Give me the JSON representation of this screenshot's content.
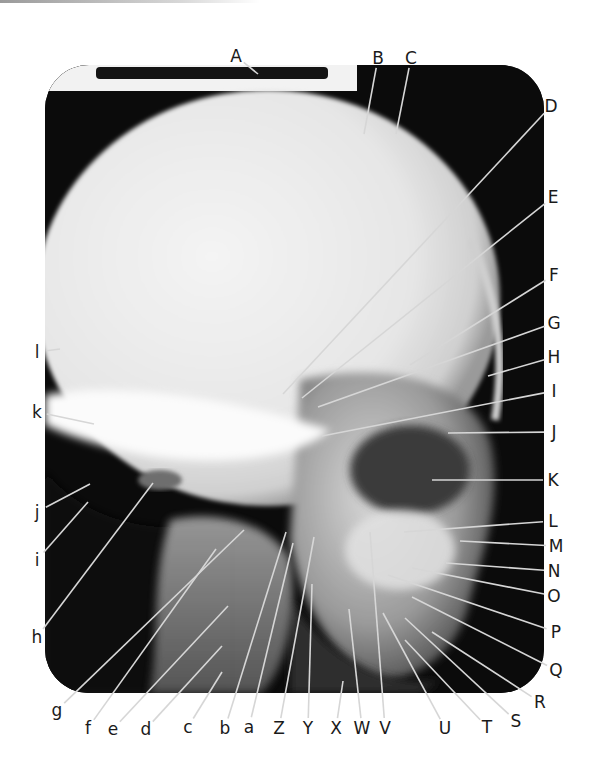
{
  "figure": {
    "labels_top": [
      "A",
      "B",
      "C"
    ],
    "labels_right": [
      "D",
      "E",
      "F",
      "G",
      "H",
      "I",
      "J",
      "K",
      "L",
      "M",
      "N",
      "O",
      "P",
      "Q",
      "R",
      "S"
    ],
    "labels_bottom": [
      "T",
      "U",
      "V",
      "W",
      "X",
      "Y",
      "Z",
      "a",
      "b",
      "c",
      "d",
      "e",
      "f",
      "g"
    ],
    "labels_left": [
      "h",
      "i",
      "j",
      "k",
      "l"
    ]
  },
  "labels": [
    {
      "id": "A",
      "x": 236,
      "y": 56,
      "tx": 258,
      "ty": 74
    },
    {
      "id": "B",
      "x": 378,
      "y": 58,
      "tx": 364,
      "ty": 134
    },
    {
      "id": "C",
      "x": 411,
      "y": 58,
      "tx": 396,
      "ty": 134
    },
    {
      "id": "D",
      "x": 551,
      "y": 106,
      "tx": 283,
      "ty": 394
    },
    {
      "id": "E",
      "x": 553,
      "y": 197,
      "tx": 302,
      "ty": 398
    },
    {
      "id": "F",
      "x": 554,
      "y": 275,
      "tx": 410,
      "ty": 365
    },
    {
      "id": "G",
      "x": 554,
      "y": 323,
      "tx": 318,
      "ty": 407
    },
    {
      "id": "H",
      "x": 554,
      "y": 357,
      "tx": 488,
      "ty": 376
    },
    {
      "id": "I",
      "x": 554,
      "y": 391,
      "tx": 322,
      "ty": 436
    },
    {
      "id": "J",
      "x": 554,
      "y": 432,
      "tx": 448,
      "ty": 433
    },
    {
      "id": "K",
      "x": 553,
      "y": 480,
      "tx": 432,
      "ty": 480
    },
    {
      "id": "L",
      "x": 553,
      "y": 521,
      "tx": 404,
      "ty": 532
    },
    {
      "id": "M",
      "x": 556,
      "y": 546,
      "tx": 460,
      "ty": 541
    },
    {
      "id": "N",
      "x": 554,
      "y": 571,
      "tx": 446,
      "ty": 563
    },
    {
      "id": "O",
      "x": 554,
      "y": 596,
      "tx": 412,
      "ty": 568
    },
    {
      "id": "P",
      "x": 556,
      "y": 632,
      "tx": 388,
      "ty": 575
    },
    {
      "id": "Q",
      "x": 556,
      "y": 670,
      "tx": 412,
      "ty": 597
    },
    {
      "id": "R",
      "x": 540,
      "y": 702,
      "tx": 432,
      "ty": 632
    },
    {
      "id": "S",
      "x": 516,
      "y": 721,
      "tx": 405,
      "ty": 618
    },
    {
      "id": "T",
      "x": 487,
      "y": 727,
      "tx": 405,
      "ty": 640
    },
    {
      "id": "U",
      "x": 445,
      "y": 728,
      "tx": 383,
      "ty": 613
    },
    {
      "id": "V",
      "x": 385,
      "y": 728,
      "tx": 370,
      "ty": 532
    },
    {
      "id": "W",
      "x": 362,
      "y": 728,
      "tx": 349,
      "ty": 609
    },
    {
      "id": "X",
      "x": 336,
      "y": 728,
      "tx": 343,
      "ty": 681
    },
    {
      "id": "Y",
      "x": 308,
      "y": 728,
      "tx": 312,
      "ty": 584
    },
    {
      "id": "Z",
      "x": 279,
      "y": 728,
      "tx": 314,
      "ty": 537
    },
    {
      "id": "a",
      "x": 249,
      "y": 727,
      "tx": 293,
      "ty": 543
    },
    {
      "id": "b",
      "x": 225,
      "y": 728,
      "tx": 286,
      "ty": 532
    },
    {
      "id": "c",
      "x": 188,
      "y": 727,
      "tx": 222,
      "ty": 672
    },
    {
      "id": "d",
      "x": 146,
      "y": 729,
      "tx": 222,
      "ty": 646
    },
    {
      "id": "e",
      "x": 113,
      "y": 729,
      "tx": 228,
      "ty": 606
    },
    {
      "id": "f",
      "x": 88,
      "y": 728,
      "tx": 216,
      "ty": 549
    },
    {
      "id": "g",
      "x": 57,
      "y": 710,
      "tx": 244,
      "ty": 530
    },
    {
      "id": "h",
      "x": 37,
      "y": 637,
      "tx": 153,
      "ty": 483
    },
    {
      "id": "i",
      "x": 37,
      "y": 560,
      "tx": 88,
      "ty": 502
    },
    {
      "id": "j",
      "x": 37,
      "y": 512,
      "tx": 90,
      "ty": 484
    },
    {
      "id": "k",
      "x": 37,
      "y": 412,
      "tx": 94,
      "ty": 424
    },
    {
      "id": "l",
      "x": 37,
      "y": 352,
      "tx": 60,
      "ty": 349
    }
  ],
  "colors": {
    "background": "#ffffff",
    "film": "#0b0b0b",
    "bone": "#e9e9e9",
    "leader_line": "#d6d6d6",
    "label_text": "#1a1a1a"
  }
}
